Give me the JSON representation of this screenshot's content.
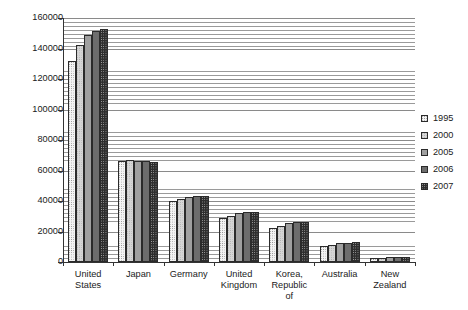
{
  "chart_data": {
    "type": "bar",
    "title": "",
    "subtitle": "",
    "xlabel": "",
    "ylabel": "",
    "ylim": [
      0,
      160000
    ],
    "ytick_step": 20000,
    "ytick_labels": [
      "160000",
      "140000",
      "120000",
      "100000",
      "80000",
      "60000",
      "40000",
      "20000",
      "0"
    ],
    "ytick_values": [
      160000,
      140000,
      120000,
      100000,
      80000,
      60000,
      40000,
      20000,
      0
    ],
    "grid": true,
    "grid_orientation": "horizontal",
    "legend_position": "right",
    "categories": [
      "United States",
      "Japan",
      "Germany",
      "United Kingdom",
      "Korea, Republic of",
      "Australia",
      "New Zealand"
    ],
    "category_label_lines": [
      [
        "United",
        "States"
      ],
      [
        "Japan"
      ],
      [
        "Germany"
      ],
      [
        "United",
        "Kingdom"
      ],
      [
        "Korea,",
        "Republic",
        "of"
      ],
      [
        "Australia"
      ],
      [
        "New",
        "Zealand"
      ]
    ],
    "series": [
      {
        "name": "1995",
        "color": "#f4f4f4",
        "values": [
          132000,
          66500,
          40000,
          29000,
          22500,
          10500,
          2600
        ]
      },
      {
        "name": "2000",
        "color": "#d6d6d6",
        "values": [
          142500,
          67000,
          41500,
          30500,
          23500,
          11200,
          2800
        ]
      },
      {
        "name": "2005",
        "color": "#a0a0a0",
        "values": [
          149000,
          66500,
          42500,
          32000,
          25500,
          12200,
          3000
        ]
      },
      {
        "name": "2006",
        "color": "#6d6d6d",
        "values": [
          151500,
          66000,
          43000,
          32500,
          26000,
          12600,
          3100
        ]
      },
      {
        "name": "2007",
        "color": "#2e2e2e",
        "values": [
          152500,
          65500,
          43000,
          33000,
          26000,
          13000,
          3200
        ]
      }
    ]
  },
  "legend": {
    "items": [
      {
        "label": "1995"
      },
      {
        "label": "2000"
      },
      {
        "label": "2005"
      },
      {
        "label": "2006"
      },
      {
        "label": "2007"
      }
    ]
  }
}
